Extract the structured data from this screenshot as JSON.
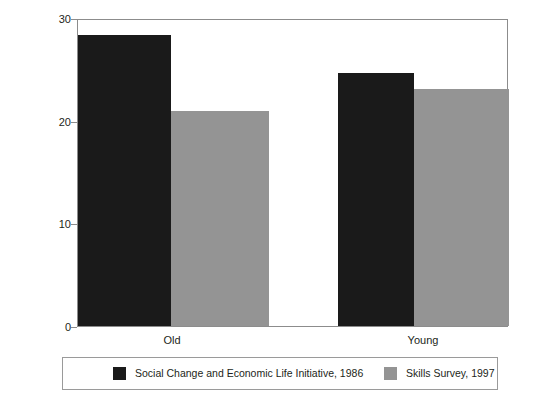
{
  "chart_data": {
    "type": "bar",
    "title": "",
    "subtitle": "",
    "xlabel": "",
    "ylabel": "% of workers",
    "categories": [
      "Old",
      "Young"
    ],
    "series": [
      {
        "name": "Social Change and Economic Life Initiative, 1986",
        "color": "#1a1a1a",
        "values": [
          28.5,
          24.8
        ]
      },
      {
        "name": "Skills Survey, 1997",
        "color": "#949494",
        "values": [
          21.1,
          23.2
        ]
      }
    ],
    "ylim": [
      0,
      30
    ],
    "yticks": [
      0,
      10,
      20,
      30
    ],
    "ytick_labels": [
      "0",
      "10",
      "20",
      "30"
    ],
    "grid": false,
    "legend_position": "bottom"
  },
  "axes": {
    "y_title": "% of workers",
    "y_ticks": [
      {
        "label": "30",
        "value": 30
      },
      {
        "label": "20",
        "value": 20
      },
      {
        "label": "10",
        "value": 10
      },
      {
        "label": "0",
        "value": 0
      }
    ],
    "x_ticks": [
      {
        "label": "Old"
      },
      {
        "label": "Young"
      }
    ]
  },
  "legend": {
    "entries": [
      {
        "label": "Social Change and Economic Life Initiative, 1986",
        "swatch": "dark"
      },
      {
        "label": "Skills Survey, 1997",
        "swatch": "light"
      }
    ]
  }
}
